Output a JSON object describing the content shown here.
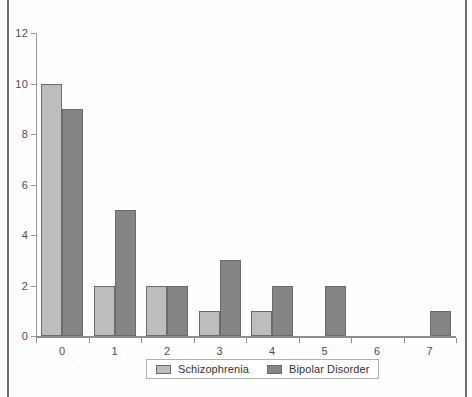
{
  "chart_data": {
    "type": "bar",
    "title": "",
    "xlabel": "",
    "ylabel": "",
    "categories": [
      "0",
      "1",
      "2",
      "3",
      "4",
      "5",
      "6",
      "7"
    ],
    "series": [
      {
        "name": "Schizophrenia",
        "color": "#bdbdbd",
        "values": [
          10,
          2,
          2,
          1,
          1,
          0,
          0,
          0
        ]
      },
      {
        "name": "Bipolar Disorder",
        "color": "#858585",
        "values": [
          9,
          5,
          2,
          3,
          2,
          2,
          0,
          1
        ]
      }
    ],
    "ylim": [
      0,
      12
    ],
    "ytick_values": [
      0,
      2,
      4,
      6,
      8,
      10,
      12
    ],
    "ytick_labels": [
      "0",
      "2",
      "4",
      "6",
      "8",
      "10",
      "12"
    ],
    "grid": false,
    "legend_position": "bottom-center"
  },
  "legend": {
    "items": [
      {
        "label": "Schizophrenia"
      },
      {
        "label": "Bipolar Disorder"
      }
    ]
  }
}
